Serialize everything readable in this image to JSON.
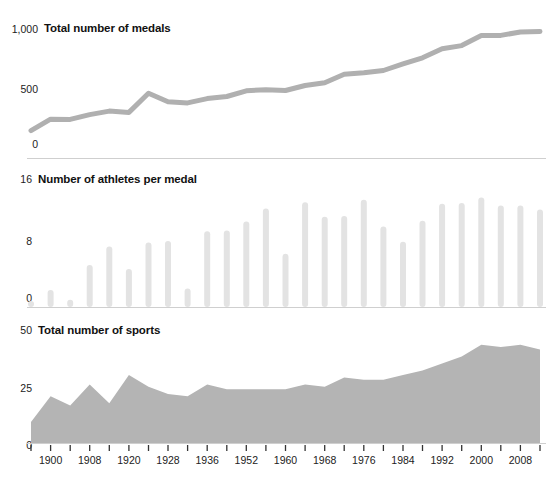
{
  "figure": {
    "background": "#ffffff",
    "line_color": "#b0b0b0",
    "bar_color": "#e3e3e3",
    "area_color": "#b4b4b4",
    "rule_color": "#cfcfcf",
    "tick_color": "#333333"
  },
  "panels": {
    "medals": {
      "title": "Total number of medals",
      "y_ticks": [
        "1,000",
        "500",
        "0"
      ]
    },
    "athletes": {
      "title": "Number of athletes per medal",
      "y_ticks": [
        "16",
        "8",
        "0"
      ]
    },
    "sports": {
      "title": "Total number of sports",
      "y_ticks": [
        "50",
        "25",
        "0"
      ]
    }
  },
  "x_axis": {
    "tick_labels": [
      "1900",
      "1908",
      "1920",
      "1928",
      "1936",
      "1952",
      "1960",
      "1968",
      "1976",
      "1984",
      "1992",
      "2000",
      "2008"
    ],
    "labelled_indices": [
      1,
      3,
      5,
      7,
      9,
      11,
      13,
      15,
      17,
      19,
      21,
      23,
      25
    ]
  },
  "chart_data": [
    {
      "type": "line",
      "title": "Total number of medals",
      "xlabel": "",
      "ylabel": "Total number of medals",
      "ylim": [
        0,
        1100
      ],
      "yticks": [
        0,
        500,
        1000
      ],
      "grid": false,
      "legend": "none",
      "x": [
        1896,
        1900,
        1904,
        1908,
        1912,
        1920,
        1924,
        1928,
        1932,
        1936,
        1948,
        1952,
        1956,
        1960,
        1964,
        1968,
        1972,
        1976,
        1980,
        1984,
        1988,
        1992,
        1996,
        2000,
        2004,
        2008,
        2012
      ],
      "values": [
        122,
        219,
        217,
        258,
        287,
        276,
        438,
        366,
        357,
        393,
        411,
        459,
        469,
        462,
        504,
        527,
        599,
        613,
        631,
        687,
        739,
        815,
        842,
        927,
        929,
        958,
        962
      ]
    },
    {
      "type": "bar",
      "title": "Number of athletes per medal",
      "xlabel": "",
      "ylabel": "Number of athletes per medal",
      "ylim": [
        0,
        16
      ],
      "yticks": [
        0,
        8,
        16
      ],
      "grid": false,
      "legend": "none",
      "categories": [
        1896,
        1900,
        1904,
        1908,
        1912,
        1920,
        1924,
        1928,
        1932,
        1936,
        1948,
        1952,
        1956,
        1960,
        1964,
        1968,
        1972,
        1976,
        1980,
        1984,
        1988,
        1992,
        1996,
        2000,
        2004,
        2008,
        2012
      ],
      "values": [
        0.6,
        2.1,
        0.9,
        5.2,
        7.5,
        4.7,
        8.0,
        8.2,
        2.3,
        9.4,
        9.5,
        10.6,
        12.2,
        6.6,
        13.0,
        11.2,
        11.3,
        13.3,
        10.0,
        8.1,
        10.7,
        12.8,
        12.9,
        13.6,
        12.6,
        12.6,
        12.1
      ]
    },
    {
      "type": "area",
      "title": "Total number of sports",
      "xlabel": "",
      "ylabel": "Total number of sports",
      "ylim": [
        0,
        50
      ],
      "yticks": [
        0,
        25,
        50
      ],
      "grid": false,
      "legend": "none",
      "x": [
        1896,
        1900,
        1904,
        1908,
        1912,
        1920,
        1924,
        1928,
        1932,
        1936,
        1948,
        1952,
        1956,
        1960,
        1964,
        1968,
        1972,
        1976,
        1980,
        1984,
        1988,
        1992,
        1996,
        2000,
        2004,
        2008,
        2012
      ],
      "values": [
        9,
        20,
        16,
        25,
        17,
        29,
        24,
        21,
        20,
        25,
        23,
        23,
        23,
        23,
        25,
        24,
        28,
        27,
        27,
        29,
        31,
        34,
        37,
        42,
        41,
        42,
        40
      ]
    }
  ]
}
